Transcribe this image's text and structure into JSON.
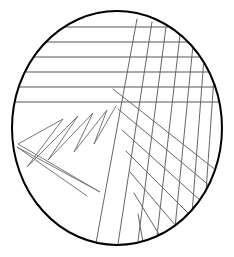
{
  "figure": {
    "width": 234,
    "height": 257,
    "background_color": "#ffffff",
    "caption": ""
  },
  "chart_data": {
    "type": "scatter",
    "subtitle": "",
    "xlabel": "",
    "ylabel": "",
    "xlim": [
      0,
      234
    ],
    "ylim": [
      0,
      257
    ],
    "grid": false,
    "legend_position": "none",
    "tick_labels_x": [],
    "tick_labels_y": [],
    "annotations": [],
    "series": [
      {
        "name": "circle-outline",
        "kind": "ellipse",
        "stroke_color": "#000000",
        "stroke_width": 2.0,
        "fill": "none",
        "cx": 117,
        "cy": 128,
        "rx": 105,
        "ry": 117
      },
      {
        "name": "horizontal-hatch-upper-left",
        "kind": "lines",
        "stroke_color": "#555555",
        "stroke_width": 1.0,
        "count": 6,
        "lines": [
          [
            53,
            27,
            168,
            27
          ],
          [
            35,
            42,
            196,
            42
          ],
          [
            25,
            57,
            210,
            57
          ],
          [
            19,
            72,
            218,
            72
          ],
          [
            15,
            87,
            222,
            87
          ],
          [
            13,
            102,
            221,
            102
          ]
        ]
      },
      {
        "name": "zigzag-sawtooth-lower-left",
        "kind": "polyline",
        "stroke_color": "#777777",
        "stroke_width": 1.0,
        "points": [
          [
            116,
            106
          ],
          [
            94,
            144
          ],
          [
            107,
            110
          ],
          [
            74,
            152
          ],
          [
            93,
            113
          ],
          [
            48,
            160
          ],
          [
            78,
            116
          ],
          [
            27,
            167
          ],
          [
            63,
            119
          ],
          [
            18,
            144
          ],
          [
            100,
            192
          ],
          [
            17,
            147
          ],
          [
            87,
            196
          ]
        ]
      },
      {
        "name": "diagonal-hatch-down-left",
        "kind": "lines",
        "stroke_color": "#666666",
        "stroke_width": 1.0,
        "count": 7,
        "lines": [
          [
            137,
            19,
            96,
            243
          ],
          [
            152,
            22,
            118,
            244
          ],
          [
            166,
            27,
            138,
            241
          ],
          [
            180,
            35,
            157,
            236
          ],
          [
            193,
            45,
            175,
            228
          ],
          [
            204,
            58,
            192,
            214
          ],
          [
            214,
            77,
            206,
            192
          ]
        ]
      },
      {
        "name": "diagonal-hatch-down-right",
        "kind": "lines",
        "stroke_color": "#666666",
        "stroke_width": 1.0,
        "count": 7,
        "lines": [
          [
            113,
            89,
            217,
            171
          ],
          [
            118,
            109,
            211,
            187
          ],
          [
            122,
            130,
            202,
            202
          ],
          [
            126,
            151,
            190,
            215
          ],
          [
            130,
            172,
            176,
            226
          ],
          [
            134,
            193,
            160,
            236
          ],
          [
            138,
            214,
            143,
            242
          ]
        ]
      }
    ]
  }
}
